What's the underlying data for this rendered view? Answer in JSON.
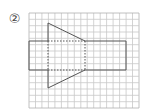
{
  "figure": {
    "label": "②",
    "grid": {
      "x0": 29,
      "y0": 13,
      "x1": 139,
      "y1": 108,
      "cols": 17,
      "rows": 15,
      "line_color": "#c8c8c8",
      "border_color": "#b0b0b0"
    },
    "shapes": {
      "rectangle": {
        "x": 29,
        "y": 41,
        "width": 97,
        "height": 29,
        "stroke": "#555555"
      },
      "trapezoid": {
        "points": [
          [
            48,
            23
          ],
          [
            85,
            41
          ],
          [
            85,
            70
          ],
          [
            48,
            88
          ]
        ],
        "stroke": "#555555"
      },
      "hidden_edges_style": "dashed"
    }
  }
}
